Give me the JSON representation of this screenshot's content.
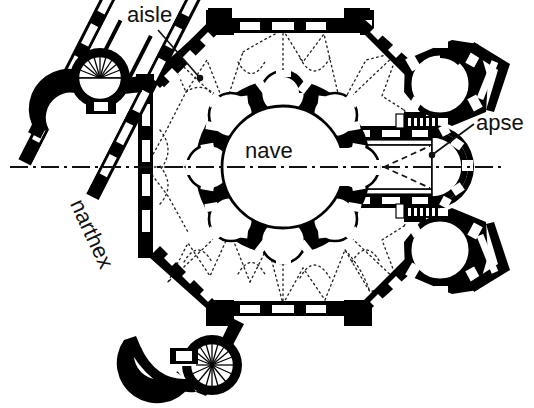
{
  "figure": {
    "kind": "architectural-floor-plan",
    "background_color": "#ffffff",
    "ink_color": "#000000",
    "symmetry_axis": "horizontal dash-dot centerline"
  },
  "labels": {
    "aisle": "aisle",
    "apse": "apse",
    "nave": "nave",
    "narthex": "narthex"
  },
  "leader_lines": [
    {
      "name": "aisle-leader",
      "from_x": 158,
      "from_y": 30,
      "to_x": 200,
      "to_y": 78
    },
    {
      "name": "apse-leader",
      "from_x": 474,
      "from_y": 124,
      "to_x": 432,
      "to_y": 155
    }
  ],
  "plan_elements": [
    {
      "name": "central-nave-rotunda",
      "type": "circle",
      "cx": 283,
      "cy": 167,
      "r": 60
    },
    {
      "name": "apsidiole-ring",
      "type": "radial-niches",
      "count": 8,
      "ring_radius": 82,
      "niche_radius": 22
    },
    {
      "name": "ambulatory-aisle",
      "type": "octagon-envelope",
      "vault_ribs": "dotted"
    },
    {
      "name": "choir-bay",
      "type": "square-bay",
      "vault": "groin-vault-dashed-x"
    },
    {
      "name": "eastern-apse",
      "type": "semicircle"
    },
    {
      "name": "corner-tower-chapel-ne",
      "type": "circle"
    },
    {
      "name": "corner-tower-chapel-se",
      "type": "circle"
    },
    {
      "name": "narthex-corridor",
      "type": "diagonal-hall",
      "angle_deg": 65
    },
    {
      "name": "spiral-stair-turret-north",
      "type": "circle-with-radial-steps",
      "steps": 22
    },
    {
      "name": "spiral-stair-turret-south",
      "type": "circle-with-radial-steps",
      "steps": 22
    },
    {
      "name": "centerline-axis",
      "type": "dash-dot-line",
      "x1": 10,
      "x2": 505,
      "y": 167
    }
  ]
}
